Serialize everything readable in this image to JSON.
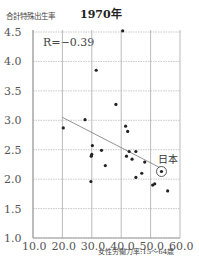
{
  "chart_data": {
    "type": "scatter",
    "title": "1970年",
    "xlabel": "女性労働力率:15～64歳",
    "ylabel": "合計特殊出生率",
    "xlim": [
      10.0,
      60.0
    ],
    "ylim": [
      1.0,
      4.5
    ],
    "xticks": [
      "10.0",
      "20.0",
      "30.0",
      "40.0",
      "50.0",
      "60.0"
    ],
    "yticks": [
      "1.0",
      "1.5",
      "2.0",
      "2.5",
      "3.0",
      "3.5",
      "4.0",
      "4.5"
    ],
    "grid": true,
    "annotation": "R=−0.39",
    "highlight": {
      "label": "日本",
      "x": 53.7,
      "y": 2.13
    },
    "trendline": {
      "x1": 20.0,
      "y1": 3.05,
      "x2": 53.0,
      "y2": 2.2
    },
    "points": [
      {
        "x": 20.3,
        "y": 2.87
      },
      {
        "x": 27.7,
        "y": 3.01
      },
      {
        "x": 29.7,
        "y": 1.96
      },
      {
        "x": 29.8,
        "y": 2.39
      },
      {
        "x": 30.0,
        "y": 2.42
      },
      {
        "x": 30.2,
        "y": 2.57
      },
      {
        "x": 31.5,
        "y": 3.85
      },
      {
        "x": 33.3,
        "y": 2.49
      },
      {
        "x": 34.6,
        "y": 2.23
      },
      {
        "x": 38.2,
        "y": 3.27
      },
      {
        "x": 40.5,
        "y": 4.52
      },
      {
        "x": 41.5,
        "y": 2.9
      },
      {
        "x": 41.8,
        "y": 2.39
      },
      {
        "x": 42.2,
        "y": 2.81
      },
      {
        "x": 42.7,
        "y": 2.47
      },
      {
        "x": 43.7,
        "y": 2.34
      },
      {
        "x": 45.0,
        "y": 2.47
      },
      {
        "x": 45.0,
        "y": 2.03
      },
      {
        "x": 47.0,
        "y": 2.1
      },
      {
        "x": 48.0,
        "y": 2.29
      },
      {
        "x": 50.7,
        "y": 1.9
      },
      {
        "x": 51.4,
        "y": 1.92
      },
      {
        "x": 53.7,
        "y": 2.13
      },
      {
        "x": 55.8,
        "y": 1.8
      }
    ]
  }
}
